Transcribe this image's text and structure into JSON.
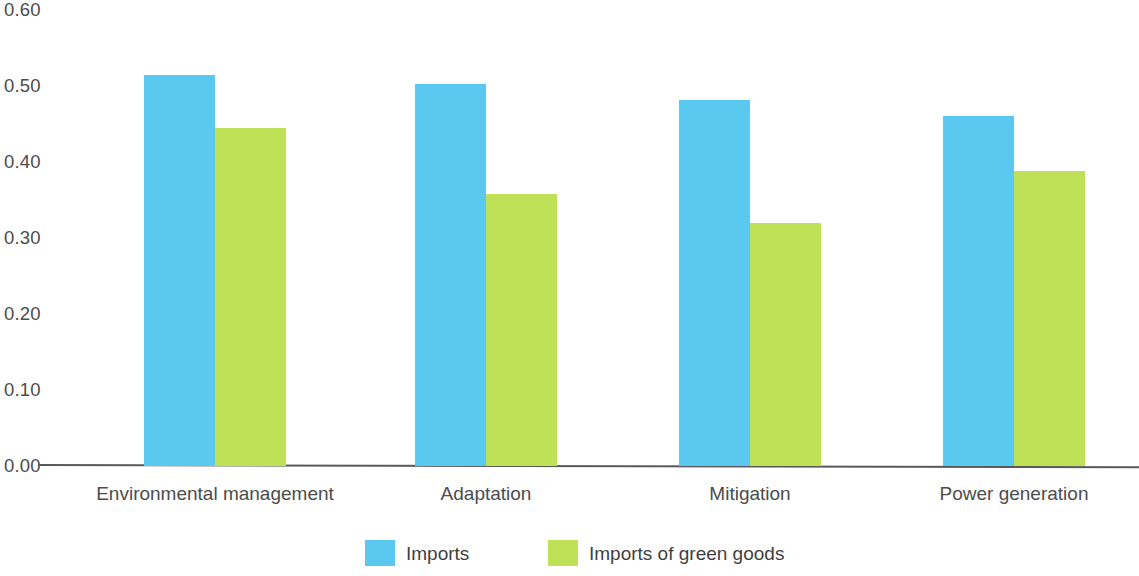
{
  "chart_data": {
    "type": "bar",
    "title": "",
    "subtitle": "",
    "xlabel": "",
    "ylabel": "",
    "ylim": [
      0.0,
      0.6
    ],
    "grid": false,
    "legend_position": "bottom",
    "categories": [
      "Environmental management",
      "Adaptation",
      "Mitigation",
      "Power generation"
    ],
    "ytick_labels": [
      "0.60",
      "0.50",
      "0.40",
      "0.30",
      "0.20",
      "0.10",
      "0.00"
    ],
    "ytick_values": [
      0.6,
      0.5,
      0.4,
      0.3,
      0.2,
      0.1,
      0.0
    ],
    "series": [
      {
        "name": "Imports",
        "color": "#5bc8f0",
        "values": [
          0.515,
          0.503,
          0.482,
          0.461
        ]
      },
      {
        "name": "Imports of green goods",
        "color": "#bfe157",
        "values": [
          0.445,
          0.358,
          0.32,
          0.388
        ]
      }
    ]
  },
  "legend": {
    "items": [
      {
        "label": "Imports",
        "color": "#5bc8f0"
      },
      {
        "label": "Imports of green goods",
        "color": "#bfe157"
      }
    ]
  },
  "axis": {
    "baseline_color": "#59595b"
  }
}
